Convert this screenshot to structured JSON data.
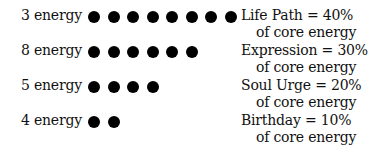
{
  "rows": [
    {
      "label": "3 energy",
      "dots": 8,
      "line1": "Life Path  =  40%",
      "line2": "of core energy"
    },
    {
      "label": "8 energy",
      "dots": 6,
      "line1": "Expression  =  30%",
      "line2": "of core energy"
    },
    {
      "label": "5 energy",
      "dots": 4,
      "line1": "Soul Urge  =  20%",
      "line2": "of core energy"
    },
    {
      "label": "4 energy",
      "dots": 2,
      "line1": "Birthday  =  10%",
      "line2": "of core energy"
    }
  ]
}
